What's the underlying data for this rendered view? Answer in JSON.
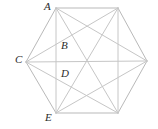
{
  "figure": {
    "type": "geometry-diagram",
    "shape_name": "hexagon-with-hexagram-diagonals",
    "canvas": {
      "width": 158,
      "height": 129
    },
    "colors": {
      "background": "#ffffff",
      "stroke": "#b9b9b9",
      "stroke_secondary": "#c6c6c6",
      "label_text": "#2b2b2b"
    },
    "stroke_width": 1,
    "labels": [
      {
        "id": "A",
        "text": "A",
        "x": 44,
        "y": 1
      },
      {
        "id": "B",
        "text": "B",
        "x": 61,
        "y": 40
      },
      {
        "id": "C",
        "text": "C",
        "x": 15,
        "y": 54
      },
      {
        "id": "D",
        "text": "D",
        "x": 61,
        "y": 68
      },
      {
        "id": "E",
        "text": "E",
        "x": 45,
        "y": 112
      }
    ],
    "vertices": [
      {
        "id": "A",
        "label": "A",
        "x": 56,
        "y": 8
      },
      {
        "id": "TR",
        "label": "",
        "x": 118,
        "y": 8
      },
      {
        "id": "R",
        "label": "",
        "x": 147,
        "y": 61
      },
      {
        "id": "BR",
        "label": "",
        "x": 118,
        "y": 113
      },
      {
        "id": "E",
        "label": "E",
        "x": 56,
        "y": 113
      },
      {
        "id": "C",
        "label": "C",
        "x": 26,
        "y": 62
      }
    ],
    "interior_points": [
      {
        "id": "B",
        "label": "B",
        "x": 56,
        "y": 45
      },
      {
        "id": "D",
        "label": "D",
        "x": 56,
        "y": 75
      }
    ],
    "edges": [
      {
        "from": "A",
        "to": "TR"
      },
      {
        "from": "TR",
        "to": "R"
      },
      {
        "from": "R",
        "to": "BR"
      },
      {
        "from": "BR",
        "to": "E"
      },
      {
        "from": "E",
        "to": "C"
      },
      {
        "from": "C",
        "to": "A"
      }
    ],
    "diagonals": [
      {
        "from": "A",
        "to": "E",
        "note": "vertical chord through B and D"
      },
      {
        "from": "A",
        "to": "R"
      },
      {
        "from": "A",
        "to": "BR"
      },
      {
        "from": "TR",
        "to": "C"
      },
      {
        "from": "TR",
        "to": "BR"
      },
      {
        "from": "TR",
        "to": "E"
      },
      {
        "from": "R",
        "to": "E"
      },
      {
        "from": "R",
        "to": "C"
      },
      {
        "from": "BR",
        "to": "C"
      }
    ]
  }
}
